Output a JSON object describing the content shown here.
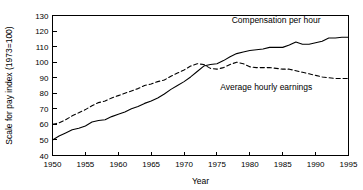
{
  "chart_data": {
    "type": "line",
    "title": "",
    "xlabel": "Year",
    "ylabel": "Scale for pay index (1973=100)",
    "xlim": [
      1950,
      1995
    ],
    "ylim": [
      40,
      130
    ],
    "xticks": [
      1950,
      1955,
      1960,
      1965,
      1970,
      1975,
      1980,
      1985,
      1990,
      1995
    ],
    "yticks": [
      40,
      50,
      60,
      70,
      80,
      90,
      100,
      110,
      120,
      130
    ],
    "grid": false,
    "legend_position": "inline-annotation",
    "series": [
      {
        "name": "Compensation per hour",
        "style": "solid",
        "color": "#000000",
        "x": [
          1950,
          1951,
          1952,
          1953,
          1954,
          1955,
          1956,
          1957,
          1958,
          1959,
          1960,
          1961,
          1962,
          1963,
          1964,
          1965,
          1966,
          1967,
          1968,
          1969,
          1970,
          1971,
          1972,
          1973,
          1974,
          1975,
          1976,
          1977,
          1978,
          1979,
          1980,
          1981,
          1982,
          1983,
          1984,
          1985,
          1986,
          1987,
          1988,
          1989,
          1990,
          1991,
          1992,
          1993,
          1994,
          1995
        ],
        "values": [
          50.0,
          52.5,
          54.5,
          56.5,
          57.5,
          59.0,
          61.5,
          62.5,
          63.0,
          65.0,
          66.5,
          68.0,
          70.0,
          71.5,
          73.5,
          75.0,
          77.0,
          79.5,
          82.5,
          85.0,
          87.5,
          90.5,
          94.0,
          97.5,
          98.5,
          99.0,
          101.0,
          103.5,
          105.5,
          106.5,
          107.5,
          108.0,
          108.5,
          109.5,
          109.5,
          109.5,
          111.0,
          113.0,
          111.5,
          111.5,
          112.5,
          113.5,
          115.5,
          115.5,
          116.0,
          116.0
        ],
        "annotation": {
          "text": "Compensation per hour",
          "x": 1984.0,
          "y": 125.0
        }
      },
      {
        "name": "Average hourly earnings",
        "style": "dashed",
        "color": "#000000",
        "x": [
          1950,
          1951,
          1952,
          1953,
          1954,
          1955,
          1956,
          1957,
          1958,
          1959,
          1960,
          1961,
          1962,
          1963,
          1964,
          1965,
          1966,
          1967,
          1968,
          1969,
          1970,
          1971,
          1972,
          1973,
          1974,
          1975,
          1976,
          1977,
          1978,
          1979,
          1980,
          1981,
          1982,
          1983,
          1984,
          1985,
          1986,
          1987,
          1988,
          1989,
          1990,
          1991,
          1992,
          1993,
          1994,
          1995
        ],
        "values": [
          60.0,
          61.0,
          63.0,
          65.5,
          67.5,
          69.5,
          72.0,
          74.0,
          75.0,
          77.0,
          78.5,
          80.0,
          81.5,
          83.0,
          85.0,
          86.0,
          87.5,
          88.5,
          91.0,
          93.0,
          95.0,
          97.5,
          99.0,
          98.5,
          96.0,
          95.5,
          96.5,
          98.5,
          100.0,
          99.0,
          97.0,
          96.5,
          96.5,
          96.5,
          96.0,
          95.5,
          95.5,
          94.5,
          93.5,
          92.5,
          91.5,
          90.5,
          90.0,
          89.5,
          89.5,
          89.5
        ],
        "annotation": {
          "text": "Average hourly earnings",
          "x": 1982.5,
          "y": 82.0
        }
      }
    ]
  },
  "figure": {
    "xlabel": "Year",
    "ylabel": "Scale for pay index (1973=100)",
    "series_one_label": "Compensation per hour",
    "series_two_label": "Average hourly earnings",
    "xticks": [
      "1950",
      "1955",
      "1960",
      "1965",
      "1970",
      "1975",
      "1980",
      "1985",
      "1990",
      "1995"
    ],
    "yticks": [
      "130",
      "120",
      "110",
      "100",
      "90",
      "80",
      "70",
      "60",
      "50",
      "40"
    ]
  }
}
